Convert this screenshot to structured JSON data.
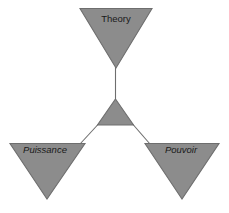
{
  "diagram": {
    "background_color": "#ffffff",
    "shape_fill_color": "#8c8c8c",
    "shape_stroke_color": "#6e6e6e",
    "connector_color": "#6e6e6e",
    "label_color": "#1a1a1a",
    "nodes": [
      {
        "id": "theory",
        "label": "Theory",
        "style": "upright",
        "orientation": "inverted-triangle",
        "position": "top",
        "label_x": 116,
        "label_y": 19
      },
      {
        "id": "center",
        "label": "",
        "style": "upright",
        "orientation": "upright-triangle",
        "position": "center",
        "label_x": 115,
        "label_y": 116
      },
      {
        "id": "puissance",
        "label": "Puissance",
        "style": "italic",
        "orientation": "inverted-triangle",
        "position": "bottom-left",
        "label_x": 45,
        "label_y": 150
      },
      {
        "id": "pouvoir",
        "label": "Pouvoir",
        "style": "italic",
        "orientation": "inverted-triangle",
        "position": "bottom-right",
        "label_x": 181,
        "label_y": 150
      }
    ],
    "connectors": [
      {
        "id": "center-to-theory",
        "from": "center",
        "to": "theory"
      },
      {
        "id": "center-to-puissance",
        "from": "center",
        "to": "puissance"
      },
      {
        "id": "center-to-pouvoir",
        "from": "center",
        "to": "pouvoir"
      }
    ]
  }
}
